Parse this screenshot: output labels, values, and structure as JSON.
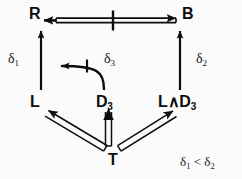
{
  "figure": {
    "background_color": "#fbfbfb",
    "ink_color": "#0d0d0d"
  },
  "nodes": [
    {
      "id": "R",
      "base": "R",
      "sub": "",
      "x": 29,
      "y": 6,
      "name": "node-r"
    },
    {
      "id": "B",
      "base": "B",
      "sub": "",
      "x": 182,
      "y": 6,
      "name": "node-b"
    },
    {
      "id": "L",
      "base": "L",
      "sub": "",
      "x": 30,
      "y": 94,
      "name": "node-l"
    },
    {
      "id": "D3",
      "base": "D",
      "sub": "3",
      "x": 96,
      "y": 94,
      "name": "node-d3"
    },
    {
      "id": "LandD3",
      "base": "L∧D",
      "sub": "3",
      "x": 158,
      "y": 94,
      "name": "node-l-and-d3"
    },
    {
      "id": "T",
      "base": "T",
      "sub": "",
      "x": 108,
      "y": 152,
      "name": "node-t"
    }
  ],
  "edge_labels": [
    {
      "base": "δ",
      "sub": "1",
      "x": 8,
      "y": 52,
      "name": "edge-label-delta-1"
    },
    {
      "base": "δ",
      "sub": "3",
      "x": 104,
      "y": 52,
      "name": "edge-label-delta-3"
    },
    {
      "base": "δ",
      "sub": "2",
      "x": 196,
      "y": 52,
      "name": "edge-label-delta-2"
    }
  ],
  "constraint": {
    "left_base": "δ",
    "left_sub": "1",
    "relation": " < ",
    "right_base": "δ",
    "right_sub": "2",
    "x": 180,
    "y": 155,
    "name": "constraint-delta1-lt-delta2"
  },
  "edges": [
    {
      "name": "edge-r-b-negated-biconditional",
      "from": "R",
      "to": "B",
      "style": "double-line",
      "arrowheads": "both",
      "negation_slash": true,
      "label": ""
    },
    {
      "name": "edge-l-to-r",
      "from": "L",
      "to": "R",
      "style": "single-line",
      "arrowheads": "end",
      "negation_slash": false,
      "label": "δ1"
    },
    {
      "name": "edge-l-and-d3-to-b",
      "from": "L∧D3",
      "to": "B",
      "style": "single-line",
      "arrowheads": "end",
      "negation_slash": false,
      "label": "δ2"
    },
    {
      "name": "edge-d3-to-l-curved-negated",
      "from": "D3",
      "to": "L",
      "style": "single-line-curved",
      "arrowheads": "end",
      "negation_slash": true,
      "label": "δ3"
    },
    {
      "name": "edge-t-to-l",
      "from": "T",
      "to": "L",
      "style": "double-line",
      "arrowheads": "end",
      "negation_slash": false,
      "label": ""
    },
    {
      "name": "edge-t-to-d3",
      "from": "T",
      "to": "D3",
      "style": "double-line",
      "arrowheads": "end",
      "negation_slash": false,
      "label": ""
    },
    {
      "name": "edge-t-to-l-and-d3",
      "from": "T",
      "to": "L∧D3",
      "style": "double-line",
      "arrowheads": "end",
      "negation_slash": false,
      "label": ""
    }
  ]
}
